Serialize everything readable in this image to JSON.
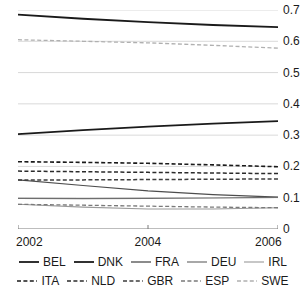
{
  "chart_data": {
    "type": "line",
    "title": "",
    "subtitle": "",
    "xlabel": "",
    "ylabel": "",
    "x": [
      2002,
      2003,
      2004,
      2005,
      2006
    ],
    "xlim": [
      2002,
      2006
    ],
    "ylim": [
      0,
      0.7
    ],
    "grid": true,
    "y_axis_position": "right",
    "legend_position": "bottom",
    "x_tick_labels": [
      "2002",
      "2004",
      "2006"
    ],
    "x_tick_values": [
      2002,
      2004,
      2006
    ],
    "y_tick_labels": [
      "0",
      "0.1",
      "0.2",
      "0.3",
      "0.4",
      "0.5",
      "0.6",
      "0.7"
    ],
    "y_tick_values": [
      0,
      0.1,
      0.2,
      0.3,
      0.4,
      0.5,
      0.6,
      0.7
    ],
    "series": [
      {
        "name": "BEL",
        "style": "solid",
        "color": "#1a1a1a",
        "width": 1.8,
        "values": [
          0.685,
          0.672,
          0.661,
          0.652,
          0.645
        ]
      },
      {
        "name": "DNK",
        "style": "solid",
        "color": "#1a1a1a",
        "width": 1.8,
        "values": [
          0.303,
          0.316,
          0.327,
          0.337,
          0.345
        ]
      },
      {
        "name": "FRA",
        "style": "solid",
        "color": "#4d4d4d",
        "width": 1.1,
        "values": [
          0.157,
          0.139,
          0.122,
          0.11,
          0.102
        ]
      },
      {
        "name": "DEU",
        "style": "solid",
        "color": "#6e6e6e",
        "width": 1.1,
        "values": [
          0.098,
          0.097,
          0.098,
          0.099,
          0.101
        ]
      },
      {
        "name": "IRL",
        "style": "solid",
        "color": "#9a9a9a",
        "width": 1.1,
        "values": [
          0.079,
          0.07,
          0.064,
          0.064,
          0.068
        ]
      },
      {
        "name": "ITA",
        "style": "dashed",
        "color": "#1a1a1a",
        "width": 1.6,
        "values": [
          0.215,
          0.213,
          0.21,
          0.205,
          0.199
        ]
      },
      {
        "name": "NLD",
        "style": "dashed",
        "color": "#2b2b2b",
        "width": 1.5,
        "values": [
          0.185,
          0.183,
          0.181,
          0.179,
          0.177
        ]
      },
      {
        "name": "GBR",
        "style": "dashed",
        "color": "#3d3d3d",
        "width": 1.5,
        "values": [
          0.157,
          0.157,
          0.158,
          0.159,
          0.16
        ]
      },
      {
        "name": "ESP",
        "style": "dashed",
        "color": "#7a7a7a",
        "width": 1.3,
        "values": [
          0.079,
          0.076,
          0.073,
          0.07,
          0.068
        ]
      },
      {
        "name": "SWE",
        "style": "dashed",
        "color": "#b0b0b0",
        "width": 1.3,
        "values": [
          0.605,
          0.6,
          0.595,
          0.587,
          0.578
        ]
      }
    ],
    "gridline_color": "#cfcfcf",
    "axis_color": "#7a7a7a",
    "text_color": "#1a1a1a"
  },
  "legend": {
    "row1": [
      {
        "label": "BEL",
        "style": "solid",
        "color": "#1a1a1a",
        "width": 1.8
      },
      {
        "label": "DNK",
        "style": "solid",
        "color": "#1a1a1a",
        "width": 1.8
      },
      {
        "label": "FRA",
        "style": "solid",
        "color": "#4d4d4d",
        "width": 1.3
      },
      {
        "label": "DEU",
        "style": "solid",
        "color": "#6e6e6e",
        "width": 1.2
      },
      {
        "label": "IRL",
        "style": "solid",
        "color": "#9a9a9a",
        "width": 1.1
      }
    ],
    "row2": [
      {
        "label": "ITA",
        "style": "dashed",
        "color": "#1a1a1a",
        "width": 1.7
      },
      {
        "label": "NLD",
        "style": "dashed",
        "color": "#2b2b2b",
        "width": 1.6
      },
      {
        "label": "GBR",
        "style": "dashed",
        "color": "#3d3d3d",
        "width": 1.5
      },
      {
        "label": "ESP",
        "style": "dashed",
        "color": "#7a7a7a",
        "width": 1.4
      },
      {
        "label": "SWE",
        "style": "dashed",
        "color": "#b0b0b0",
        "width": 1.3
      }
    ]
  }
}
